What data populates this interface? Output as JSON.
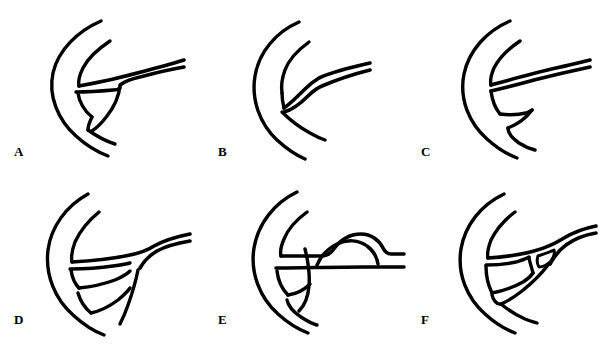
{
  "figure": {
    "title": "",
    "background_color": "#ffffff",
    "stroke_color": "#000000",
    "width": 612,
    "height": 345,
    "grid": {
      "columns": 3,
      "rows": 2
    },
    "panels": [
      {
        "id": "A",
        "label": "A",
        "label_x": 14,
        "label_y": 145,
        "origin_x": 0,
        "origin_y": 0,
        "description": "line drawing variant A"
      },
      {
        "id": "B",
        "label": "B",
        "label_x": 218,
        "label_y": 145,
        "origin_x": 204,
        "origin_y": 0,
        "description": "line drawing variant B"
      },
      {
        "id": "C",
        "label": "C",
        "label_x": 421,
        "label_y": 145,
        "origin_x": 408,
        "origin_y": 0,
        "description": "line drawing variant C"
      },
      {
        "id": "D",
        "label": "D",
        "label_x": 14,
        "label_y": 313,
        "origin_x": 0,
        "origin_y": 172,
        "description": "line drawing variant D"
      },
      {
        "id": "E",
        "label": "E",
        "label_x": 218,
        "label_y": 313,
        "origin_x": 204,
        "origin_y": 172,
        "description": "line drawing variant E"
      },
      {
        "id": "F",
        "label": "F",
        "label_x": 421,
        "label_y": 313,
        "origin_x": 408,
        "origin_y": 172,
        "description": "line drawing variant F"
      }
    ]
  }
}
